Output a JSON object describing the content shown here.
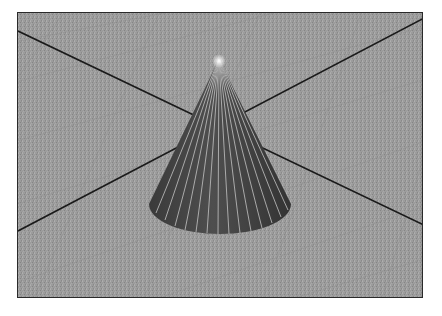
{
  "figure": {
    "colors": {
      "background": "#ffffff",
      "ground": "#9a9a9a",
      "grid": "#8a8a8a",
      "axis_line": "#1a1a1a",
      "cone_body": "#4a4a4a",
      "cone_dark": "#353535",
      "cone_highlight": "#f2f2f2",
      "cone_stripe": "#bdbdbd",
      "frame_border": "#2a2a2a"
    },
    "cone": {
      "apex": [
        218,
        58
      ],
      "base_center": [
        219,
        203
      ],
      "base_rx": 71,
      "base_ry": 30,
      "stripe_count": 14
    },
    "axis_lines": [
      {
        "from": [
          0,
          18
        ],
        "to": [
          406,
          212
        ]
      },
      {
        "from": [
          406,
          5
        ],
        "to": [
          0,
          218
        ]
      }
    ]
  },
  "caption": {
    "visible": "partially (cut off at bottom edge)",
    "text": null
  }
}
